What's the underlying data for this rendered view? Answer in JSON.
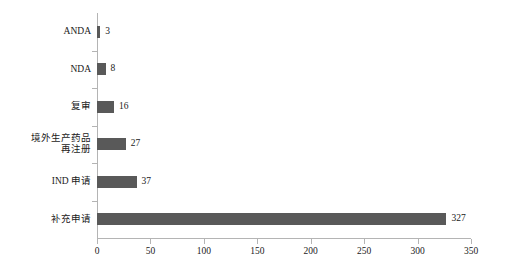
{
  "chart_data": {
    "type": "bar",
    "orientation": "horizontal",
    "title": "",
    "subtitle": "",
    "xlabel": "",
    "ylabel": "",
    "categories": [
      "ANDA",
      "NDA",
      "复审",
      "境外生产药品\n再注册",
      "IND 申请",
      "补充申请"
    ],
    "values": [
      3,
      8,
      16,
      27,
      37,
      327
    ],
    "value_labels": [
      "3",
      "8",
      "16",
      "27",
      "37",
      "327"
    ],
    "xlim": [
      0,
      350
    ],
    "xticks": [
      0,
      50,
      100,
      150,
      200,
      250,
      300,
      350
    ],
    "xtick_labels": [
      "0",
      "50",
      "100",
      "150",
      "200",
      "250",
      "300",
      "350"
    ],
    "grid": false,
    "legend": null,
    "bar_color": "#595959",
    "axis_color": "#b4b4b4",
    "text_color": "#1a1a1a",
    "background": "#ffffff"
  }
}
